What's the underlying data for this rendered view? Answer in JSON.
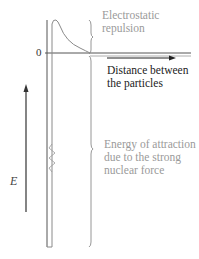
{
  "diagram": {
    "type": "potential-energy-well",
    "labels": {
      "zero": "0",
      "energy_axis": "E",
      "x_axis": [
        "Distance between",
        "the particles"
      ],
      "repulsion": [
        "Electrostatic",
        "repulsion"
      ],
      "attraction": [
        "Energy of attraction",
        "due to the strong",
        "nuclear force"
      ]
    },
    "colors": {
      "axis": "#333333",
      "curve": "#8a8a8a",
      "annotation_text": "#9a9a9a",
      "axis_text": "#222222"
    }
  }
}
